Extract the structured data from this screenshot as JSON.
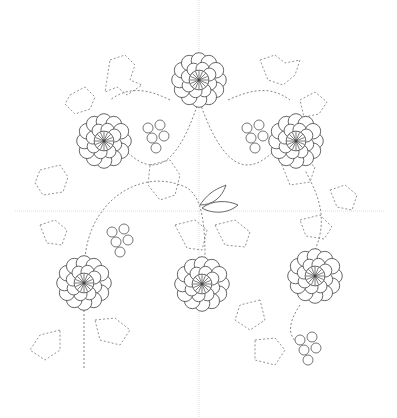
{
  "canvas": {
    "width": 397,
    "height": 418,
    "background": "#ffffff"
  },
  "guides": {
    "vertical_x": 199,
    "horizontal_y": 211
  },
  "flowers": [
    {
      "name": "flower-top",
      "cx": 199,
      "cy": 80,
      "r": 26
    },
    {
      "name": "flower-upper-left",
      "cx": 104,
      "cy": 141,
      "r": 26
    },
    {
      "name": "flower-upper-right",
      "cx": 296,
      "cy": 141,
      "r": 26
    },
    {
      "name": "flower-lower-left",
      "cx": 84,
      "cy": 283,
      "r": 26
    },
    {
      "name": "flower-lower-center",
      "cx": 202,
      "cy": 284,
      "r": 26
    },
    {
      "name": "flower-lower-right",
      "cx": 315,
      "cy": 276,
      "r": 26
    }
  ],
  "berry_clusters": [
    {
      "name": "berries-upper-left",
      "x": 148,
      "y": 128
    },
    {
      "name": "berries-upper-right",
      "x": 247,
      "y": 128
    },
    {
      "name": "berries-mid-left",
      "x": 112,
      "y": 232
    },
    {
      "name": "berries-lower-right",
      "x": 300,
      "y": 340
    }
  ],
  "colors": {
    "line": "#555555",
    "guide": "#c8c8c8"
  }
}
